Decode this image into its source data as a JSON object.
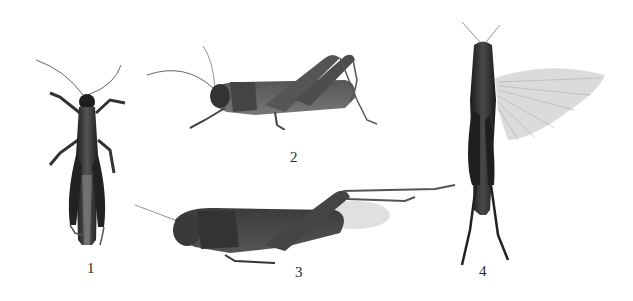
{
  "figure": {
    "background": "#ffffff",
    "specimen_color": "#3a3a3a",
    "panels": [
      {
        "id": 1,
        "label": "1",
        "view": "dorsal"
      },
      {
        "id": 2,
        "label": "2",
        "view": "lateral"
      },
      {
        "id": 3,
        "label": "3",
        "view": "lateral"
      },
      {
        "id": 4,
        "label": "4",
        "view": "dorsal, wing spread"
      }
    ]
  }
}
